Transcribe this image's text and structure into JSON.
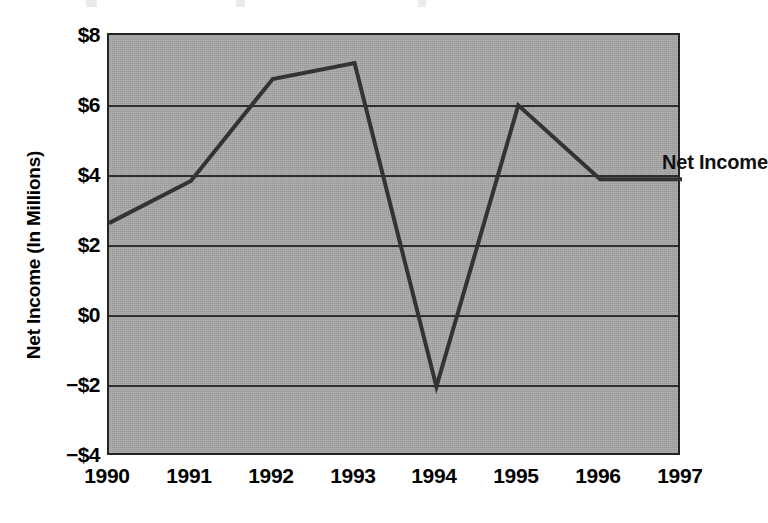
{
  "chart_data": {
    "type": "line",
    "title": "",
    "subtitle": "",
    "xlabel": "",
    "ylabel": "Net Income (In Millions)",
    "series_label": "Net Income",
    "categories": [
      "1990",
      "1991",
      "1992",
      "1993",
      "1994",
      "1995",
      "1996",
      "1997"
    ],
    "series": [
      {
        "name": "Net Income",
        "values": [
          2.65,
          3.85,
          6.75,
          7.2,
          -2.0,
          6.0,
          3.9,
          3.9
        ]
      }
    ],
    "ylim": [
      -4,
      8
    ],
    "ytick_values": [
      8,
      6,
      4,
      2,
      0,
      -2,
      -4
    ],
    "ytick_labels": [
      "$8",
      "$6",
      "$4",
      "$2",
      "$0",
      "−$2",
      "−$4"
    ],
    "xtick_labels": [
      "1990",
      "1991",
      "1992",
      "1993",
      "1994",
      "1995",
      "1996",
      "1997"
    ],
    "grid": true,
    "grid_axis": "y",
    "legend": "inline-annotation",
    "legend_position": "inside-right",
    "units": "millions of dollars",
    "colors": {
      "plot_background": "#a9a9a9",
      "page_background": "#ffffff",
      "line": "#333333",
      "gridline": "#2e2e2e",
      "axis_frame": "#242424",
      "text": "#000000"
    }
  }
}
